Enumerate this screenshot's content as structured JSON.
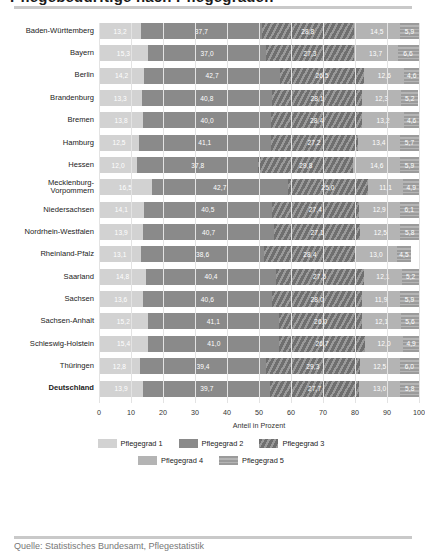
{
  "header": {
    "title_clipped": "Pflegebedürftige nach Pflegegraden",
    "rule": "horizontal-rule"
  },
  "footer": {
    "note_clipped": "Quelle: Statistisches Bundesamt, Pflegestatistik"
  },
  "chart_data": {
    "type": "bar",
    "orientation": "horizontal",
    "stacked": true,
    "stack_mode": "percent",
    "title": "Pflegebedürftige nach Pflegegraden",
    "xlabel": "Anteil in Prozent",
    "ylabel": "",
    "xlim": [
      0,
      100
    ],
    "xticks": [
      0,
      10,
      20,
      30,
      40,
      50,
      60,
      70,
      80,
      90,
      100
    ],
    "xtick_labels": [
      "0",
      "10",
      "20",
      "30",
      "40",
      "50",
      "60",
      "70",
      "80",
      "90",
      "100"
    ],
    "grid": true,
    "grid_axis": "x",
    "legend_position": "bottom",
    "legend": [
      "Pflegegrad 1",
      "Pflegegrad 2",
      "Pflegegrad 3",
      "Pflegegrad 4",
      "Pflegegrad 5"
    ],
    "colors": [
      "#d2d2d2",
      "#8a8a8a",
      "#6f6f6f",
      "#b4b4b4",
      "#9b9b9b"
    ],
    "categories": [
      "Baden-Württemberg",
      "Bayern",
      "Berlin",
      "Brandenburg",
      "Bremen",
      "Hamburg",
      "Hessen",
      "Mecklenburg-Vorpommern",
      "Niedersachsen",
      "Nordrhein-Westfalen",
      "Rheinland-Pfalz",
      "Saarland",
      "Sachsen",
      "Sachsen-Anhalt",
      "Schleswig-Holstein",
      "Thüringen",
      "Deutschland"
    ],
    "series": [
      {
        "name": "Pflegegrad 1",
        "color": "#d2d2d2",
        "values": [
          13.2,
          15.3,
          14.2,
          13.3,
          13.8,
          12.5,
          12.0,
          16.5,
          14.1,
          13.9,
          13.1,
          14.8,
          13.6,
          15.2,
          15.4,
          12.8,
          13.9
        ],
        "labels": [
          "13,2",
          "15,3",
          "14,2",
          "13,3",
          "13,8",
          "12,5",
          "12,0",
          "16,5",
          "14,1",
          "13,9",
          "13,1",
          "14,8",
          "13,6",
          "15,2",
          "15,4",
          "12,8",
          "13,9"
        ]
      },
      {
        "name": "Pflegegrad 2",
        "color": "#8a8a8a",
        "values": [
          37.7,
          37.0,
          42.7,
          40.8,
          40.0,
          41.1,
          37.8,
          42.7,
          40.5,
          40.7,
          38.6,
          40.4,
          40.6,
          41.1,
          41.0,
          39.4,
          39.7
        ],
        "labels": [
          "37,7",
          "37,0",
          "42,7",
          "40,8",
          "40,0",
          "41,1",
          "37,8",
          "42,7",
          "40,5",
          "40,7",
          "38,6",
          "40,4",
          "40,6",
          "41,1",
          "41,0",
          "39,4",
          "39,7"
        ]
      },
      {
        "name": "Pflegegrad 3",
        "color": "#6f6f6f",
        "values": [
          28.8,
          27.3,
          26.5,
          28.1,
          28.4,
          27.2,
          29.8,
          25.0,
          27.4,
          27.1,
          28.4,
          27.5,
          28.0,
          26.0,
          26.7,
          29.3,
          27.7
        ],
        "labels": [
          "28,8",
          "27,3",
          "26,5",
          "28,1",
          "28,4",
          "27,2",
          "29,8",
          "25,0",
          "27,4",
          "27,1",
          "28,4",
          "27,5",
          "28,0",
          "26,0",
          "26,7",
          "29,3",
          "27,7"
        ]
      },
      {
        "name": "Pflegegrad 4",
        "color": "#b4b4b4",
        "values": [
          14.5,
          13.7,
          12.6,
          12.3,
          13.2,
          13.4,
          14.6,
          11.1,
          12.9,
          12.5,
          13.0,
          12.1,
          11.9,
          12.1,
          12.0,
          12.5,
          13.0
        ],
        "labels": [
          "14,5",
          "13,7",
          "12,6",
          "12,3",
          "13,2",
          "13,4",
          "14,6",
          "11,1",
          "12,9",
          "12,5",
          "13,0",
          "12,1",
          "11,9",
          "12,1",
          "12,0",
          "12,5",
          "13,0"
        ]
      },
      {
        "name": "Pflegegrad 5",
        "color": "#9b9b9b",
        "values": [
          5.9,
          6.6,
          4.6,
          5.2,
          4.6,
          5.7,
          5.9,
          4.9,
          6.1,
          5.8,
          4.5,
          5.2,
          5.9,
          5.6,
          4.9,
          6.0,
          5.8
        ],
        "labels": [
          "5,9",
          "6,6",
          "4,6",
          "5,2",
          "4,6",
          "5,7",
          "5,9",
          "4,9",
          "6,1",
          "5,8",
          "4,5",
          "5,2",
          "5,9",
          "5,6",
          "4,9",
          "6,0",
          "5,8"
        ]
      }
    ]
  }
}
